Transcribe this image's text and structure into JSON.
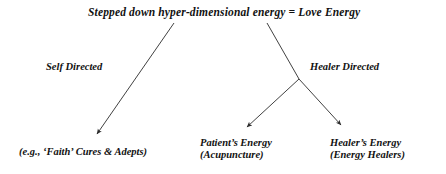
{
  "diagram": {
    "title": "Stepped down hyper-dimensional  energy  =  Love Energy",
    "branch_labels": {
      "left": "Self Directed",
      "right": "Healer Directed"
    },
    "leaves": {
      "faith": {
        "line1": "(e.g., ‘Faith’ Cures & Adepts)"
      },
      "patient": {
        "line1": "Patient’s Energy",
        "line2": "(Acupuncture)"
      },
      "healer": {
        "line1": "Healer’s Energy",
        "line2": "(Energy Healers)"
      }
    },
    "colors": {
      "ink": "#111111",
      "background": "#ffffff",
      "arrow": "#2b2b2b"
    }
  }
}
